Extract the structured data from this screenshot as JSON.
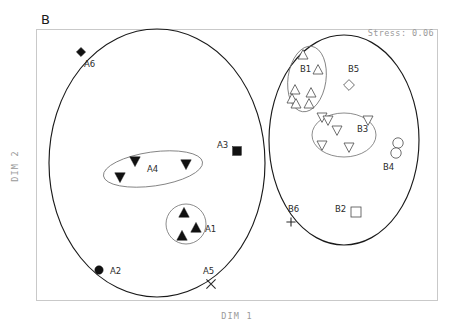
{
  "figure": {
    "panel_label": "B",
    "stress_label": "Stress: 0.06",
    "xlabel": "DIM 1",
    "ylabel": "DIM 2"
  },
  "chart_data": {
    "type": "scatter",
    "title": "B",
    "subtitle": "Stress: 0.06",
    "xlabel": "DIM 1",
    "ylabel": "DIM 2",
    "grid": false,
    "legend": "none",
    "annotations": [
      "Stress: 0.06"
    ],
    "axis_ticks": {
      "x": [],
      "y": []
    },
    "xlim": [
      0,
      100
    ],
    "ylim": [
      0,
      100
    ],
    "groups": [
      {
        "name": "A1",
        "label": "A1",
        "marker": "filled-triangle-up",
        "label_x": 205,
        "label_y": 232,
        "enclosure": {
          "shape": "circle",
          "cx": 186,
          "cy": 224,
          "rx": 20,
          "ry": 20,
          "rotation": 0
        },
        "points": [
          {
            "x": 184,
            "y": 213
          },
          {
            "x": 196,
            "y": 228
          },
          {
            "x": 182,
            "y": 236
          }
        ]
      },
      {
        "name": "A2",
        "label": "A2",
        "marker": "filled-circle",
        "label_x": 110,
        "label_y": 274,
        "points": [
          {
            "x": 99,
            "y": 270
          }
        ]
      },
      {
        "name": "A3",
        "label": "A3",
        "marker": "filled-square",
        "label_x": 217,
        "label_y": 148,
        "points": [
          {
            "x": 237,
            "y": 151
          }
        ]
      },
      {
        "name": "A4",
        "label": "A4",
        "marker": "filled-triangle-down",
        "label_x": 147,
        "label_y": 172,
        "enclosure": {
          "shape": "ellipse",
          "cx": 153,
          "cy": 169,
          "rx": 50,
          "ry": 17,
          "rotation": -8
        },
        "points": [
          {
            "x": 135,
            "y": 161
          },
          {
            "x": 186,
            "y": 164
          },
          {
            "x": 120,
            "y": 177
          }
        ]
      },
      {
        "name": "A5",
        "label": "A5",
        "marker": "x-cross",
        "label_x": 203,
        "label_y": 274,
        "points": [
          {
            "x": 211,
            "y": 284
          }
        ]
      },
      {
        "name": "A6",
        "label": "A6",
        "marker": "filled-diamond",
        "label_x": 84,
        "label_y": 67,
        "points": [
          {
            "x": 81,
            "y": 52
          }
        ]
      },
      {
        "name": "B1",
        "label": "B1",
        "marker": "open-triangle-up",
        "label_x": 300,
        "label_y": 72,
        "enclosure": {
          "shape": "ellipse",
          "cx": 307,
          "cy": 79,
          "rx": 19,
          "ry": 33,
          "rotation": 8
        },
        "points": [
          {
            "x": 303,
            "y": 55
          },
          {
            "x": 318,
            "y": 70
          },
          {
            "x": 295,
            "y": 90
          },
          {
            "x": 311,
            "y": 93
          },
          {
            "x": 292,
            "y": 99
          },
          {
            "x": 296,
            "y": 104
          },
          {
            "x": 309,
            "y": 104
          }
        ]
      },
      {
        "name": "B2",
        "label": "B2",
        "marker": "open-square",
        "label_x": 335,
        "label_y": 212,
        "points": [
          {
            "x": 356,
            "y": 212
          }
        ]
      },
      {
        "name": "B3",
        "label": "B3",
        "marker": "open-triangle-down",
        "label_x": 357,
        "label_y": 132,
        "enclosure": {
          "shape": "ellipse",
          "cx": 344,
          "cy": 135,
          "rx": 32,
          "ry": 22,
          "rotation": 0
        },
        "points": [
          {
            "x": 322,
            "y": 117
          },
          {
            "x": 328,
            "y": 120
          },
          {
            "x": 368,
            "y": 120
          },
          {
            "x": 337,
            "y": 130
          },
          {
            "x": 322,
            "y": 145
          },
          {
            "x": 349,
            "y": 147
          }
        ]
      },
      {
        "name": "B4",
        "label": "B4",
        "marker": "open-circle",
        "label_x": 383,
        "label_y": 170,
        "points": [
          {
            "x": 398,
            "y": 143
          },
          {
            "x": 396,
            "y": 153
          }
        ]
      },
      {
        "name": "B5",
        "label": "B5",
        "marker": "open-diamond",
        "label_x": 348,
        "label_y": 72,
        "points": [
          {
            "x": 349,
            "y": 85
          }
        ]
      },
      {
        "name": "B6",
        "label": "B6",
        "marker": "plus-cross",
        "label_x": 288,
        "label_y": 212,
        "points": [
          {
            "x": 291,
            "y": 222
          }
        ]
      }
    ],
    "hulls": [
      {
        "name": "group-A-hull",
        "cx": 157,
        "cy": 163,
        "rx": 108,
        "ry": 134,
        "rotation": 0
      },
      {
        "name": "group-B-hull",
        "cx": 344,
        "cy": 140,
        "rx": 75,
        "ry": 105,
        "rotation": 0
      }
    ]
  },
  "colors": {
    "marker_fill": "#111111",
    "marker_open_stroke": "#4a4a4a",
    "hull_stroke": "#1a1a1a",
    "frame_stroke": "#c9c9c9",
    "muted_text": "#9a9a9a"
  }
}
